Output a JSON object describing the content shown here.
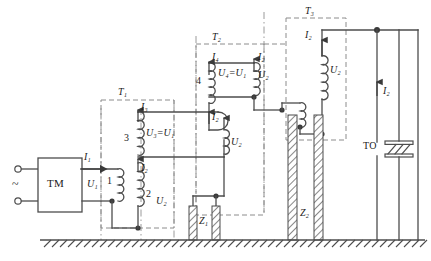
{
  "diagram": {
    "colors": {
      "wire": "#4d4d4d",
      "dash_box": "#8c8c8c",
      "dash_dot": "#9a9a9a",
      "ground": "#4d4d4d",
      "hatch": "#555555",
      "text": "#1a1a1a",
      "background": "#ffffff"
    },
    "source": {
      "supply_symbol": "~",
      "terminal_top": "terminal-o",
      "terminal_bottom": "terminal-o",
      "regulator_label": "TM"
    },
    "transformers": [
      {
        "name": "T1",
        "label": "T₁",
        "windings": [
          {
            "number": "1",
            "voltage": "U₁"
          },
          {
            "number": "2",
            "voltage": "U₂"
          },
          {
            "number": "3",
            "voltage": "U₃=U₁"
          }
        ],
        "currents": [
          "I₁",
          "I₂",
          "I₃"
        ]
      },
      {
        "name": "T2",
        "label": "T₂",
        "windings": [
          {
            "number": "4",
            "voltage": "U₄=U₁"
          },
          {
            "number": "",
            "voltage": "U₂"
          }
        ],
        "currents": [
          "I₄",
          "I₂"
        ]
      },
      {
        "name": "T3",
        "label": "T₃",
        "windings": [
          {
            "number": "",
            "voltage": "U₁"
          },
          {
            "number": "",
            "voltage": "U₂"
          }
        ],
        "currents": [
          "I₂"
        ]
      }
    ],
    "insulators": [
      {
        "name": "Z1",
        "label": "Z₁"
      },
      {
        "name": "Z2",
        "label": "Z₂"
      }
    ],
    "load": {
      "label": "TO",
      "current": "I₂"
    },
    "labels": {
      "T1": "T₁",
      "T2": "T₂",
      "T3": "T₃",
      "I1": "I₁",
      "I2": "I₂",
      "I3": "I₃",
      "I4": "I₄",
      "U1": "U₁",
      "U2": "U₂",
      "U3_eq": "U₃=U₁",
      "U4_eq": "U₄=U₁",
      "w1": "1",
      "w2": "2",
      "w3": "3",
      "w4": "4",
      "Z1": "Z₁",
      "Z2": "Z₂",
      "TM": "TM",
      "TO": "TO",
      "tilde": "~"
    }
  }
}
